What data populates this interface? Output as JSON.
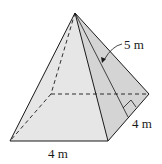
{
  "figure": {
    "type": "square-pyramid",
    "labels": {
      "slant_height": "5 m",
      "base_depth": "4 m",
      "base_width": "4 m"
    },
    "colors": {
      "line": "#1a1a1a",
      "front_face": "#e4e4e4",
      "right_face": "#d2d2d2",
      "left_face": "#eeeeee",
      "background": "#ffffff"
    }
  }
}
